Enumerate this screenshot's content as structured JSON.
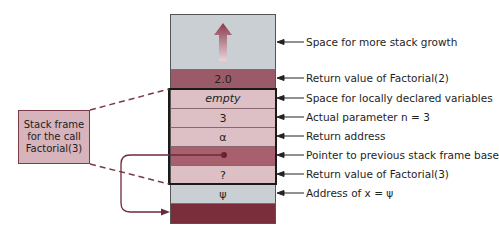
{
  "diagram": {
    "type": "runtime stack frame",
    "stack_rows": [
      {
        "id": "growth",
        "text": "",
        "annotation": "Space for more stack growth",
        "color": "#c9cfd2"
      },
      {
        "id": "return-factorial-2",
        "text": "2.0",
        "annotation": "Return value of Factorial(2)",
        "color": "#9b5a68"
      },
      {
        "id": "locals",
        "text": "empty",
        "annotation": "Space for locally declared variables",
        "color": "#dcc0c6"
      },
      {
        "id": "param",
        "text": "3",
        "annotation": "Actual parameter n = 3",
        "color": "#dcc0c6"
      },
      {
        "id": "return-address",
        "text": "α",
        "annotation": "Return address",
        "color": "#dcc0c6"
      },
      {
        "id": "prev-frame-pointer",
        "text": "",
        "annotation": "Pointer to previous stack frame base",
        "color": "#a8606e"
      },
      {
        "id": "return-factorial-3",
        "text": "?",
        "annotation": "Return value of Factorial(3)",
        "color": "#dcc0c6"
      },
      {
        "id": "address-x",
        "text": "ψ",
        "annotation": "Address of x = ψ",
        "color": "#c9cfd2"
      },
      {
        "id": "previous-frame",
        "text": "",
        "annotation": "",
        "color": "#7a2e3c"
      }
    ],
    "callout": {
      "line1": "Stack frame",
      "line2": "for the call",
      "line3": "Factorial(3)"
    }
  }
}
